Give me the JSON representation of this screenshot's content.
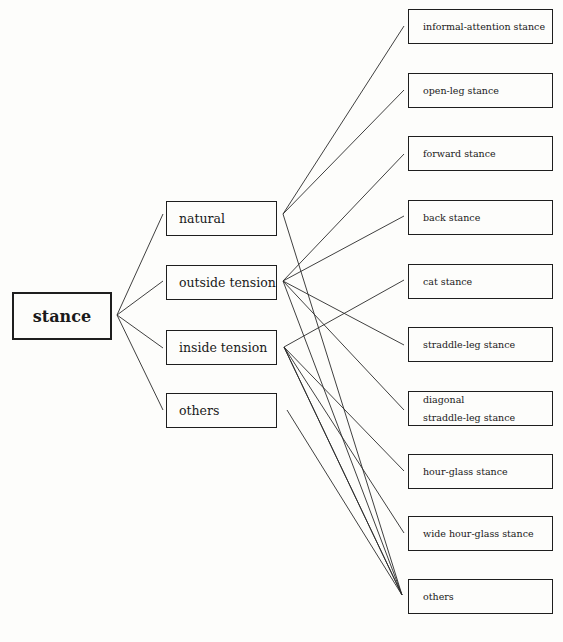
{
  "diagram": {
    "root": {
      "label": "stance"
    },
    "categories": [
      {
        "label": "natural",
        "top": 201,
        "apex": [
          283,
          214
        ]
      },
      {
        "label": "outside tension",
        "top": 265,
        "apex": [
          283,
          281
        ]
      },
      {
        "label": "inside tension",
        "top": 330,
        "apex": [
          284,
          347
        ]
      },
      {
        "label": "others",
        "top": 393,
        "apex": [
          287,
          410
        ]
      }
    ],
    "leaves": [
      {
        "label": "informal-attention stance",
        "top": 9
      },
      {
        "label": "open-leg stance",
        "top": 73
      },
      {
        "label": "forward stance",
        "top": 136
      },
      {
        "label": "back stance",
        "top": 200
      },
      {
        "label": "cat stance",
        "top": 264
      },
      {
        "label": "straddle-leg stance",
        "top": 327
      },
      {
        "label_line1": "diagonal",
        "label_line2": "straddle-leg stance",
        "top": 391
      },
      {
        "label": "hour-glass stance",
        "top": 454
      },
      {
        "label": "wide hour-glass stance",
        "top": 516
      },
      {
        "label": "others",
        "top": 579
      }
    ],
    "connections": {
      "natural": [
        "informal-attention stance",
        "open-leg stance",
        "others"
      ],
      "outside tension": [
        "forward stance",
        "back stance",
        "straddle-leg stance",
        "diagonal straddle-leg stance",
        "others"
      ],
      "inside tension": [
        "cat stance",
        "hour-glass stance",
        "wide hour-glass stance",
        "others"
      ],
      "others": [
        "others"
      ]
    }
  }
}
